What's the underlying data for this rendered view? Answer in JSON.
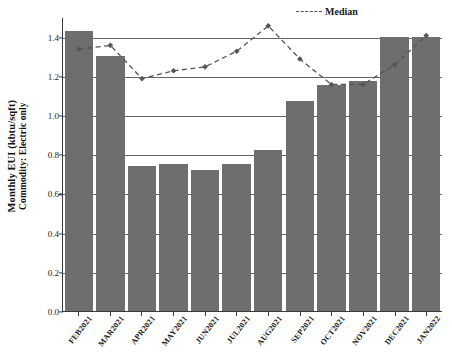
{
  "chart_data": {
    "type": "bar",
    "title": "",
    "subtitle": "",
    "xlabel": "",
    "ylabel": "Monthly EUI (kbtu/sqft)",
    "ylabel_sub": "Commodity: Electric only",
    "ylim": [
      0.0,
      1.5
    ],
    "ytick_labels": [
      "0.0",
      "0.2",
      "0.4",
      "0.6",
      "0.8",
      "1.0",
      "1.2",
      "1.4"
    ],
    "ytick_values": [
      0.0,
      0.2,
      0.4,
      0.6,
      0.8,
      1.0,
      1.2,
      1.4
    ],
    "grid": true,
    "grid_axis": "y",
    "legend_position": "top-right",
    "categories": [
      "FEB2021",
      "MAR2021",
      "APR2021",
      "MAY2021",
      "JUN2021",
      "JUL2021",
      "AUG2021",
      "SEP2021",
      "OCT2021",
      "NOV2021",
      "DEC2021",
      "JAN2022"
    ],
    "series": [
      {
        "name": "Monthly EUI",
        "type": "bar",
        "color": "#6e6e6e",
        "values": [
          1.43,
          1.3,
          0.74,
          0.75,
          0.72,
          0.75,
          0.82,
          1.07,
          1.155,
          1.175,
          1.4,
          1.4
        ]
      },
      {
        "name": "Median",
        "type": "line",
        "style": "dashed",
        "color": "#555555",
        "marker": "diamond",
        "values": [
          1.34,
          1.36,
          1.19,
          1.23,
          1.25,
          1.33,
          1.46,
          1.29,
          1.16,
          1.16,
          1.26,
          1.41
        ]
      }
    ]
  },
  "legend": {
    "median_label": "Median"
  },
  "caption": {
    "text": ""
  }
}
